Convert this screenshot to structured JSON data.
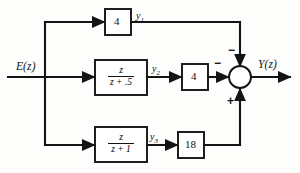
{
  "figure": {
    "type": "control-system-block-diagram",
    "input_label": "E(z)",
    "output_label": "Y(z)",
    "summing_junction": {
      "name": "summer",
      "signs": {
        "top": "−",
        "left": "−",
        "bottom": "+"
      }
    },
    "signals": {
      "y1": "y",
      "y1_sub": "1",
      "y2": "y",
      "y2_sub": "2",
      "y3": "y",
      "y3_sub": "3"
    },
    "branches": [
      {
        "id": "top",
        "block_label": "4",
        "signal_label": "y",
        "signal_sub": "1",
        "enters_summer": "top",
        "sign": "−"
      },
      {
        "id": "middle",
        "transfer_numerator": "z",
        "transfer_denominator": "z + .5",
        "signal_label": "y",
        "signal_sub": "2",
        "gain_label": "4",
        "enters_summer": "left",
        "sign": "−"
      },
      {
        "id": "bottom",
        "transfer_numerator": "z",
        "transfer_denominator": "z + 1",
        "signal_label": "y",
        "signal_sub": "3",
        "gain_label": "18",
        "enters_summer": "bottom",
        "sign": "+"
      }
    ],
    "colors": {
      "line": "#141414",
      "block_fill": "#ffffff",
      "background": "#fdfdfb"
    }
  }
}
